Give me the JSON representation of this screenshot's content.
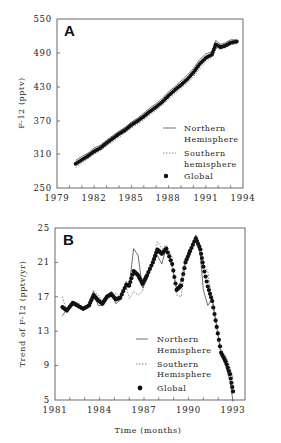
{
  "chart_data": [
    {
      "panel": "A",
      "type": "line",
      "title": "",
      "panel_label": "A",
      "xlabel": "",
      "ylabel": "F-12 (pptv)",
      "xlim": [
        1979,
        1994
      ],
      "ylim": [
        250,
        550
      ],
      "xticks": [
        1979,
        1982,
        1985,
        1988,
        1991,
        1994
      ],
      "yticks": [
        250,
        310,
        370,
        430,
        490,
        550
      ],
      "legend": [
        "Northern Hemisphere",
        "Southern hemisphere",
        "Global"
      ],
      "legend_position": "lower right",
      "x": [
        1980.5,
        1981.0,
        1981.5,
        1982.0,
        1982.5,
        1983.0,
        1983.5,
        1984.0,
        1984.5,
        1985.0,
        1985.5,
        1986.0,
        1986.5,
        1987.0,
        1987.5,
        1988.0,
        1988.5,
        1989.0,
        1989.5,
        1990.0,
        1990.5,
        1991.0,
        1991.5,
        1991.8,
        1992.2,
        1992.6,
        1993.0,
        1993.5
      ],
      "series": [
        {
          "name": "Northern Hemisphere",
          "style": "solid",
          "values": [
            299,
            306,
            312,
            321,
            326,
            335,
            343,
            351,
            358,
            367,
            374,
            383,
            392,
            400,
            409,
            421,
            430,
            440,
            450,
            462,
            478,
            488,
            492,
            512,
            505,
            508,
            513,
            513
          ]
        },
        {
          "name": "Southern hemisphere",
          "style": "dashed",
          "values": [
            286,
            294,
            302,
            310,
            316,
            325,
            332,
            340,
            348,
            356,
            363,
            371,
            380,
            388,
            397,
            407,
            417,
            427,
            436,
            447,
            461,
            474,
            482,
            498,
            496,
            499,
            504,
            506
          ]
        },
        {
          "name": "Global",
          "style": "dots",
          "values": [
            293,
            300,
            307,
            315,
            321,
            330,
            338,
            346,
            353,
            362,
            369,
            377,
            386,
            394,
            403,
            414,
            424,
            433,
            443,
            455,
            470,
            481,
            487,
            505,
            500,
            503,
            508,
            510
          ]
        }
      ]
    },
    {
      "panel": "B",
      "type": "line",
      "title": "",
      "panel_label": "B",
      "xlabel": "Time (months)",
      "ylabel": "Trend of F-12 (pptv/yr)",
      "xlim": [
        1981,
        1993
      ],
      "ylim": [
        5,
        25
      ],
      "xticks": [
        1981,
        1984,
        1987,
        1990,
        1993
      ],
      "yticks": [
        5,
        9,
        13,
        17,
        21,
        25
      ],
      "legend": [
        "Northern Hemisphere",
        "Southern Hemisphere",
        "Global"
      ],
      "legend_position": "lower right",
      "x": [
        1981.5,
        1981.8,
        1982.2,
        1982.5,
        1982.9,
        1983.3,
        1983.6,
        1983.9,
        1984.2,
        1984.5,
        1984.8,
        1985.1,
        1985.4,
        1985.8,
        1986.0,
        1986.3,
        1986.6,
        1986.9,
        1987.2,
        1987.6,
        1987.9,
        1988.2,
        1988.5,
        1988.9,
        1989.2,
        1989.5,
        1989.8,
        1990.1,
        1990.5,
        1990.8,
        1991.0,
        1991.3,
        1991.6,
        1991.9,
        1992.2,
        1992.5,
        1992.8,
        1993.0
      ],
      "series": [
        {
          "name": "Northern Hemisphere",
          "style": "solid",
          "values": [
            14.8,
            15.6,
            16.5,
            16.2,
            15.4,
            16.2,
            17.6,
            16.0,
            16.0,
            17.2,
            17.6,
            16.2,
            16.6,
            18.8,
            18.2,
            22.6,
            21.8,
            18.0,
            19.0,
            21.2,
            21.8,
            20.8,
            22.8,
            20.4,
            18.0,
            18.8,
            21.4,
            22.6,
            24.2,
            21.8,
            17.8,
            16.0,
            16.8,
            13.6,
            10.2,
            9.0,
            7.2,
            4.8
          ]
        },
        {
          "name": "Southern Hemisphere",
          "style": "dashed",
          "values": [
            17.0,
            15.2,
            16.0,
            16.4,
            15.8,
            15.8,
            17.8,
            17.2,
            16.6,
            16.8,
            17.2,
            17.4,
            17.0,
            18.2,
            16.8,
            17.6,
            17.2,
            17.6,
            19.8,
            20.8,
            23.4,
            22.6,
            23.0,
            21.6,
            17.2,
            17.0,
            20.8,
            22.4,
            23.8,
            23.0,
            20.8,
            20.0,
            16.4,
            13.4,
            10.8,
            10.2,
            8.8,
            7.6
          ]
        },
        {
          "name": "Global",
          "style": "dots",
          "values": [
            15.8,
            15.4,
            16.3,
            16.0,
            15.6,
            16.0,
            17.2,
            16.6,
            16.2,
            17.0,
            17.3,
            16.7,
            16.9,
            18.4,
            18.3,
            20.0,
            19.5,
            18.5,
            19.5,
            21.0,
            22.5,
            22.0,
            22.6,
            20.8,
            17.8,
            18.3,
            21.0,
            22.3,
            23.8,
            22.5,
            20.5,
            18.2,
            16.5,
            13.5,
            10.5,
            9.5,
            8.0,
            6.0
          ]
        }
      ]
    }
  ],
  "panelA": {
    "letter": "A",
    "ylabel": "F-12 (pptv)",
    "yticks": [
      "550",
      "490",
      "430",
      "370",
      "310",
      "250"
    ],
    "xticks": [
      "1979",
      "1982",
      "1985",
      "1988",
      "1991",
      "1994"
    ],
    "legend": {
      "nh1": "Northern",
      "nh2": "Hemisphere",
      "sh1": "Southern",
      "sh2": "hemisphere",
      "gl": "Global"
    }
  },
  "panelB": {
    "letter": "B",
    "ylabel": "Trend of F-12 (pptv/yr)",
    "xlabel": "Time (months)",
    "yticks": [
      "25",
      "21",
      "17",
      "13",
      "9",
      "5"
    ],
    "xticks": [
      "1981",
      "1984",
      "1987",
      "1990",
      "1993"
    ],
    "legend": {
      "nh1": "Northern",
      "nh2": "Hemisphere",
      "sh1": "Southern",
      "sh2": "Hemisphere",
      "gl": "Global"
    }
  }
}
